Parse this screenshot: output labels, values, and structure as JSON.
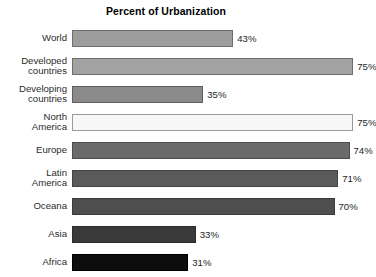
{
  "chart_data": {
    "type": "bar",
    "orientation": "horizontal",
    "title": "Percent of Urbanization",
    "xlabel": "",
    "ylabel": "",
    "xlim": [
      0,
      80
    ],
    "grid": false,
    "legend": false,
    "value_suffix": "%",
    "categories": [
      "World",
      "Developed countries",
      "Developing countries",
      "North America",
      "Europe",
      "Latin America",
      "Oceana",
      "Asia",
      "Africa"
    ],
    "values": [
      43,
      75,
      35,
      75,
      74,
      71,
      70,
      33,
      31
    ],
    "series": [
      {
        "name": "Percent of Urbanization",
        "values": [
          43,
          75,
          35,
          75,
          74,
          71,
          70,
          33,
          31
        ]
      }
    ],
    "bars": [
      {
        "label": "World",
        "label_lines": "World",
        "value": 43,
        "value_label": "43%",
        "fill": "#9d9d9d",
        "border": "#6e6e6e"
      },
      {
        "label": "Developed countries",
        "label_lines": "Developed\ncountries",
        "value": 75,
        "value_label": "75%",
        "fill": "#a2a2a2",
        "border": "#6e6e6e"
      },
      {
        "label": "Developing countries",
        "label_lines": "Developing\ncountries",
        "value": 35,
        "value_label": "35%",
        "fill": "#8a8a8a",
        "border": "#5f5f5f"
      },
      {
        "label": "North America",
        "label_lines": "North\nAmerica",
        "value": 75,
        "value_label": "75%",
        "fill": "#f7f7f7",
        "border": "#9a9a9a"
      },
      {
        "label": "Europe",
        "label_lines": "Europe",
        "value": 74,
        "value_label": "74%",
        "fill": "#6a6a6a",
        "border": "#4d4d4d"
      },
      {
        "label": "Latin America",
        "label_lines": "Latin\nAmerica",
        "value": 71,
        "value_label": "71%",
        "fill": "#5a5a5a",
        "border": "#434343"
      },
      {
        "label": "Oceana",
        "label_lines": "Oceana",
        "value": 70,
        "value_label": "70%",
        "fill": "#4e4e4e",
        "border": "#3a3a3a"
      },
      {
        "label": "Asia",
        "label_lines": "Asia",
        "value": 33,
        "value_label": "33%",
        "fill": "#3a3a3a",
        "border": "#2b2b2b"
      },
      {
        "label": "Africa",
        "label_lines": "Africa",
        "value": 31,
        "value_label": "31%",
        "fill": "#0d0d0d",
        "border": "#000000"
      }
    ]
  },
  "layout": {
    "bar_area_px": 300,
    "scale_max": 80
  }
}
